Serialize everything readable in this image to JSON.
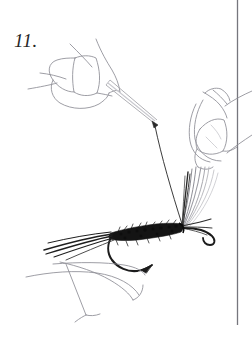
{
  "figure": {
    "caption_number": "11.",
    "background_color": "#ffffff",
    "ink_color": "#1a1a1a",
    "outline_color": "#8a8a92",
    "border_color": "#7b7b82",
    "elements": {
      "step_label": "11.",
      "right_rule": "vertical-page-rule",
      "left_hand": "thumb-and-finger-holding-bodkin",
      "bodkin": "bodkin-needle",
      "thread": "tying-thread",
      "right_hand": "two-fingers-pinching-wing",
      "wing": "hackle-wing-fibers",
      "body": "dubbed-fly-body",
      "tail": "tail-fibers",
      "hook": "hook-bend-point-and-eye",
      "vise": "vise-jaw"
    }
  }
}
